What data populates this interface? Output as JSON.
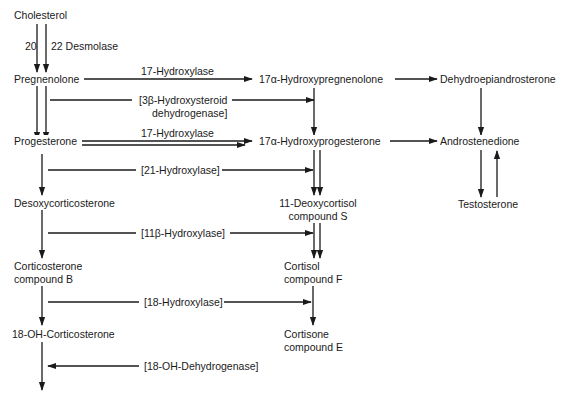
{
  "diagram": {
    "type": "steroid biosynthesis pathway",
    "compounds": {
      "cholesterol": "Cholesterol",
      "pregnenolone": "Pregnenolone",
      "hydroxypregnenolone": "17α-Hydroxypregnenolone",
      "dhea": "Dehydroepiandrosterone",
      "progesterone": "Progesterone",
      "hydroxyprogesterone": "17α-Hydroxyprogesterone",
      "androstenedione": "Androstenedione",
      "desoxycorticosterone": "Desoxycorticosterone",
      "deoxycortisol_l1": "11-Deoxycortisol",
      "deoxycortisol_l2": "compound S",
      "testosterone": "Testosterone",
      "corticosterone_l1": "Corticosterone",
      "corticosterone_l2": "compound B",
      "cortisol_l1": "Cortisol",
      "cortisol_l2": "compound F",
      "oh_corticosterone": "18-OH-Corticosterone",
      "cortisone_l1": "Cortisone",
      "cortisone_l2": "compound E"
    },
    "enzymes": {
      "desmolase_a": "20",
      "desmolase_sep": ",",
      "desmolase_b": "22 Desmolase",
      "hydroxylase17_top": "17-Hydroxylase",
      "hsd_l1": "[3β-Hydroxysteroid",
      "hsd_l2": "dehydrogenase]",
      "hydroxylase17_mid": "17-Hydroxylase",
      "hydroxylase21": "[21-Hydroxylase]",
      "hydroxylase11b": "[11β-Hydroxylase]",
      "hydroxylase18": "[18-Hydroxylase]",
      "oh_dehydrogenase18": "[18-OH-Dehydrogenase]"
    },
    "colors": {
      "line": "#1a1a1a",
      "background": "#ffffff"
    }
  }
}
